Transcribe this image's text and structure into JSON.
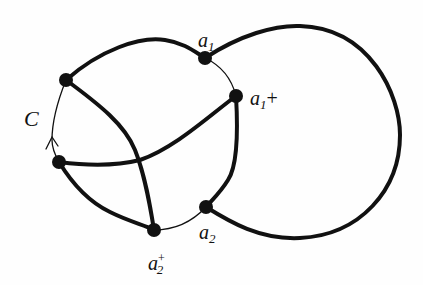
{
  "diagram": {
    "labels": {
      "c": "C",
      "a1_base": "a",
      "a1_sub": "1",
      "a1p_base": "a",
      "a1p_sub": "1",
      "a1p_suffix": "+",
      "a2_base": "a",
      "a2_sub": "2",
      "a2p_base": "a",
      "a2p_sub": "2",
      "a2p_sup": "+"
    },
    "nodes": [
      {
        "id": "p1",
        "x": 66,
        "y": 80
      },
      {
        "id": "a1",
        "x": 205,
        "y": 58
      },
      {
        "id": "a1+",
        "x": 236,
        "y": 96
      },
      {
        "id": "p4",
        "x": 59,
        "y": 162
      },
      {
        "id": "a2",
        "x": 206,
        "y": 207
      },
      {
        "id": "a2+",
        "x": 154,
        "y": 230
      }
    ],
    "colors": {
      "stroke": "#111111",
      "background": "#fefefe"
    }
  }
}
